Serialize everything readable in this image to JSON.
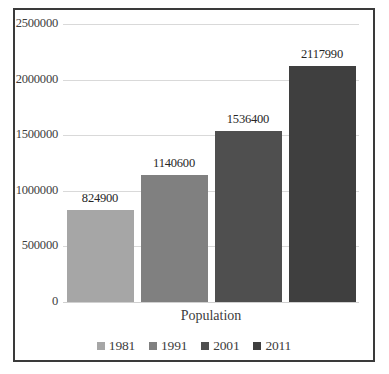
{
  "chart_data": {
    "type": "bar",
    "title": "",
    "subtitle": "",
    "xlabel": "Population",
    "ylabel": "",
    "categories": [
      "Population"
    ],
    "series": [
      {
        "name": "1981",
        "values": [
          824900
        ],
        "color": "#a6a6a6"
      },
      {
        "name": "1991",
        "values": [
          1140600
        ],
        "color": "#808080"
      },
      {
        "name": "2001",
        "values": [
          1536400
        ],
        "color": "#4f4f4f"
      },
      {
        "name": "2011",
        "values": [
          2117990
        ],
        "color": "#3f3f3f"
      }
    ],
    "data_labels": [
      "824900",
      "1140600",
      "1536400",
      "2117990"
    ],
    "ylim": [
      0,
      2500000
    ],
    "ytick_values": [
      0,
      500000,
      1000000,
      1500000,
      2000000,
      2500000
    ],
    "ytick_labels": [
      "0",
      "500000",
      "1000000",
      "1500000",
      "2000000",
      "2500000"
    ],
    "grid": true,
    "legend_position": "bottom",
    "legend_entries": [
      "1981",
      "1991",
      "2001",
      "2011"
    ]
  },
  "axis": {
    "category_label": "Population"
  },
  "style": {
    "border_color": "#3a3a3a",
    "gridline_color": "#d9d9d9",
    "text_color": "#3d3d3d"
  }
}
